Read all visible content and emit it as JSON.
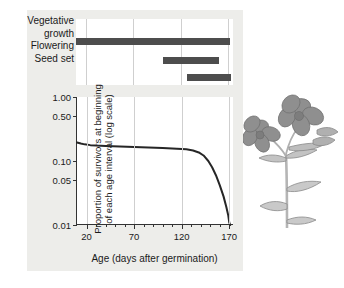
{
  "figure": {
    "background_color": "#ffffff",
    "panel_color": "#ededea",
    "plot_background": "#ffffff",
    "bar_color": "#4d4d4d",
    "grid_color": "#cfcfcf",
    "axis_color": "#333333",
    "curve_color": "#262626",
    "illustration": "flowering-plant-illustration"
  },
  "phenology": {
    "stages": [
      {
        "label_line1": "Vegetative",
        "label_line2": "growth",
        "start": 10,
        "end": 172
      },
      {
        "label_line1": "Flowering",
        "label_line2": "",
        "start": 101,
        "end": 160
      },
      {
        "label_line1": "Seed set",
        "label_line2": "",
        "start": 127,
        "end": 173
      }
    ],
    "gridlines": [
      20,
      70,
      120,
      170
    ]
  },
  "chart_data": {
    "type": "line",
    "title": "",
    "xlabel": "Age (days after germination)",
    "ylabel_line1": "Proportion of survivors at beginning",
    "ylabel_line2": "of each age interval (log scale)",
    "xlim": [
      10,
      175
    ],
    "ylim": [
      0.01,
      1.0
    ],
    "yscale": "log",
    "grid": true,
    "legend": "none",
    "xticks": [
      20,
      70,
      120,
      170
    ],
    "xticklabels": [
      "20",
      "70",
      "120",
      "170"
    ],
    "xminor_ticks": [
      30,
      40,
      50,
      60,
      80,
      90,
      100,
      110,
      130,
      140,
      150,
      160
    ],
    "yticks": [
      1.0,
      0.5,
      0.1,
      0.05,
      0.01
    ],
    "yticklabels": [
      "1.00",
      "0.50",
      "0.10",
      "0.05",
      "0.01"
    ],
    "series": [
      {
        "name": "survivorship",
        "x": [
          10,
          14,
          18,
          24,
          30,
          40,
          55,
          70,
          85,
          100,
          115,
          125,
          132,
          138,
          143,
          148,
          152,
          156,
          160,
          164,
          167,
          169,
          170,
          171
        ],
        "y": [
          0.195,
          0.188,
          0.182,
          0.177,
          0.174,
          0.171,
          0.168,
          0.166,
          0.163,
          0.16,
          0.156,
          0.152,
          0.146,
          0.136,
          0.122,
          0.1,
          0.08,
          0.06,
          0.042,
          0.028,
          0.019,
          0.014,
          0.011,
          0.01
        ]
      }
    ]
  }
}
